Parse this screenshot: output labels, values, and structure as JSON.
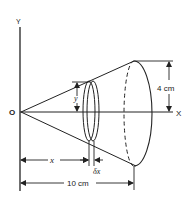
{
  "diagram": {
    "type": "cone-volume-by-disks",
    "axes": {
      "y_label": "Y",
      "x_label": "X",
      "origin_label": "O"
    },
    "dimensions": {
      "radius_label": "4 cm",
      "height_label": "10 cm",
      "disk_position_label": "x",
      "disk_radius_label": "y",
      "disk_thickness_label": "δx"
    },
    "colors": {
      "line": "#222222",
      "background": "#ffffff"
    }
  }
}
